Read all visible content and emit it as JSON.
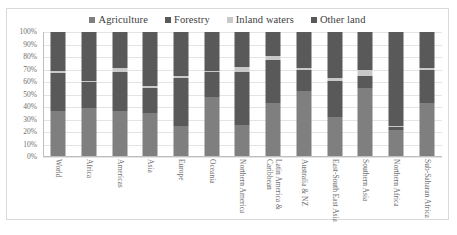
{
  "chart_data": {
    "type": "bar",
    "subtype": "100% stacked column",
    "title": "",
    "xlabel": "",
    "ylabel": "",
    "ylim": [
      0,
      100
    ],
    "yticks": [
      "0%",
      "10%",
      "20%",
      "30%",
      "40%",
      "50%",
      "60%",
      "70%",
      "80%",
      "90%",
      "100%"
    ],
    "grid": true,
    "legend_position": "top-center",
    "categories": [
      "World",
      "Africa",
      "Americas",
      "Asia",
      "Europe",
      "Oceania",
      "Northern America",
      "Latin America &\nCaribbean",
      "Australia & NZ",
      "East-South East Asia",
      "Southern Asia",
      "Northern Africa",
      "Sub-Saharan Africa"
    ],
    "series": [
      {
        "name": "Agriculture",
        "color": "#7f7f7f",
        "values": [
          37,
          39,
          37,
          35,
          25,
          48,
          26,
          43,
          53,
          32,
          55,
          22,
          43
        ]
      },
      {
        "name": "Forestry",
        "color": "#595959",
        "values": [
          30,
          21,
          31,
          20,
          38,
          20,
          42,
          35,
          17,
          29,
          10,
          2,
          27
        ]
      },
      {
        "name": "Inland waters",
        "color": "#c9c9c9",
        "values": [
          2,
          1,
          3,
          2,
          2,
          1,
          4,
          3,
          1,
          2,
          5,
          1,
          1
        ]
      },
      {
        "name": "Other land",
        "color": "#595959",
        "values": [
          31,
          39,
          29,
          43,
          35,
          31,
          28,
          19,
          29,
          37,
          30,
          75,
          29
        ]
      }
    ]
  },
  "legend": {
    "items": [
      {
        "label": "Agriculture",
        "color": "#7f7f7f"
      },
      {
        "label": "Forestry",
        "color": "#595959"
      },
      {
        "label": "Inland waters",
        "color": "#c9c9c9"
      },
      {
        "label": "Other land",
        "color": "#595959"
      }
    ]
  }
}
